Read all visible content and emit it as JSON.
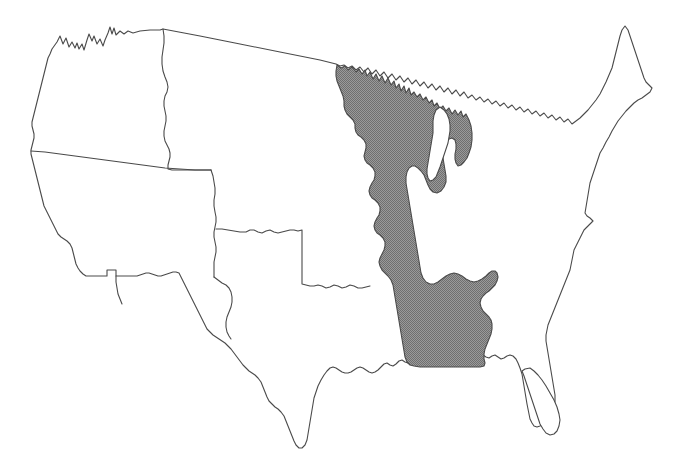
{
  "figure": {
    "kind": "choropleth-outline-map",
    "title": "",
    "caption": "",
    "width_px": 681,
    "height_px": 466,
    "background_color": "#ffffff"
  },
  "style": {
    "outline_color": "#4a4a4a",
    "outline_width_px": 1,
    "land_fill": "#ffffff",
    "highlight_fill": "#8c8c8c",
    "highlight_pattern": "dithered-halftone-gray",
    "lake_fill": "#ffffff"
  },
  "regions": [
    {
      "id": "highlighted-central-region",
      "label": "",
      "shaded": true,
      "fill": "#8c8c8c",
      "states_covered": [
        "Minnesota",
        "Wisconsin",
        "Michigan",
        "Iowa",
        "Illinois",
        "Indiana",
        "Missouri",
        "Kentucky",
        "Tennessee",
        "Arkansas",
        "Mississippi",
        "Alabama"
      ]
    },
    {
      "id": "unshaded-remainder",
      "label": "",
      "shaded": false,
      "fill": "#ffffff",
      "states_covered": [
        "Washington",
        "Oregon",
        "California",
        "Idaho",
        "Nevada",
        "Arizona",
        "Utah",
        "Montana",
        "Wyoming",
        "Colorado",
        "New Mexico",
        "North Dakota",
        "South Dakota",
        "Nebraska",
        "Kansas",
        "Oklahoma",
        "Texas",
        "Louisiana",
        "Florida",
        "Georgia",
        "South Carolina",
        "North Carolina",
        "Virginia",
        "West Virginia",
        "Ohio",
        "Maryland",
        "Delaware",
        "Pennsylvania",
        "New Jersey",
        "New York",
        "Connecticut",
        "Rhode Island",
        "Massachusetts",
        "Vermont",
        "New Hampshire",
        "Maine"
      ]
    }
  ],
  "internal_dividers": [
    {
      "id": "pacific-northwest-divider",
      "label": ""
    },
    {
      "id": "mountain-west-divider",
      "label": ""
    },
    {
      "id": "great-plains-divider",
      "label": ""
    },
    {
      "id": "southwest-divider",
      "label": ""
    }
  ],
  "water_bodies": [
    {
      "id": "lake-michigan",
      "label": ""
    }
  ],
  "legend": {
    "visible": false,
    "entries": []
  },
  "annotations": []
}
